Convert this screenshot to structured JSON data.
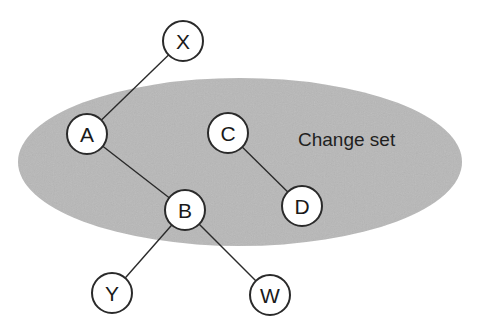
{
  "diagram": {
    "colors": {
      "background": "#ffffff",
      "set_fill": "#b8b8b8",
      "node_fill": "#ffffff",
      "stroke": "#2a2a2a"
    },
    "region": {
      "label": "Change set",
      "cx": 240,
      "cy": 162,
      "rx": 222,
      "ry": 84,
      "label_x": 298,
      "label_y": 146
    },
    "nodes": [
      {
        "id": "X",
        "label": "X",
        "x": 183,
        "y": 41
      },
      {
        "id": "A",
        "label": "A",
        "x": 87,
        "y": 134
      },
      {
        "id": "C",
        "label": "C",
        "x": 228,
        "y": 133
      },
      {
        "id": "B",
        "label": "B",
        "x": 185,
        "y": 210
      },
      {
        "id": "D",
        "label": "D",
        "x": 302,
        "y": 206
      },
      {
        "id": "Y",
        "label": "Y",
        "x": 112,
        "y": 293
      },
      {
        "id": "W",
        "label": "W",
        "x": 270,
        "y": 295
      }
    ],
    "edges": [
      {
        "from": "X",
        "to": "A"
      },
      {
        "from": "A",
        "to": "B"
      },
      {
        "from": "C",
        "to": "D"
      },
      {
        "from": "B",
        "to": "Y"
      },
      {
        "from": "B",
        "to": "W"
      }
    ],
    "node_radius": 20
  }
}
